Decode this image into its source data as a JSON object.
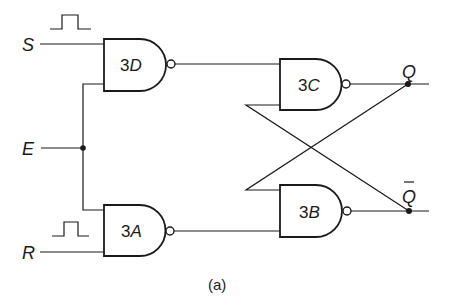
{
  "diagram": {
    "type": "gated SR latch (NAND)",
    "caption": "(a)",
    "inputs": [
      {
        "id": "S",
        "label": "S"
      },
      {
        "id": "E",
        "label": "E"
      },
      {
        "id": "R",
        "label": "R"
      }
    ],
    "outputs": [
      {
        "id": "Q",
        "label": "Q"
      },
      {
        "id": "Qbar",
        "label": "Q",
        "overbar": true
      }
    ],
    "gates": [
      {
        "id": "3D",
        "num": "3",
        "letter": "D",
        "type": "NAND",
        "inputs": [
          "S",
          "E"
        ],
        "output": "3C.in1"
      },
      {
        "id": "3A",
        "num": "3",
        "letter": "A",
        "type": "NAND",
        "inputs": [
          "E",
          "R"
        ],
        "output": "3B.in2"
      },
      {
        "id": "3C",
        "num": "3",
        "letter": "C",
        "type": "NAND",
        "inputs": [
          "3D",
          "Qbar"
        ],
        "output": "Q"
      },
      {
        "id": "3B",
        "num": "3",
        "letter": "B",
        "type": "NAND",
        "inputs": [
          "Q",
          "3A"
        ],
        "output": "Qbar"
      }
    ],
    "pulse_symbols": [
      {
        "on": "S",
        "name": "positive-pulse"
      },
      {
        "on": "R",
        "name": "positive-pulse"
      }
    ]
  }
}
